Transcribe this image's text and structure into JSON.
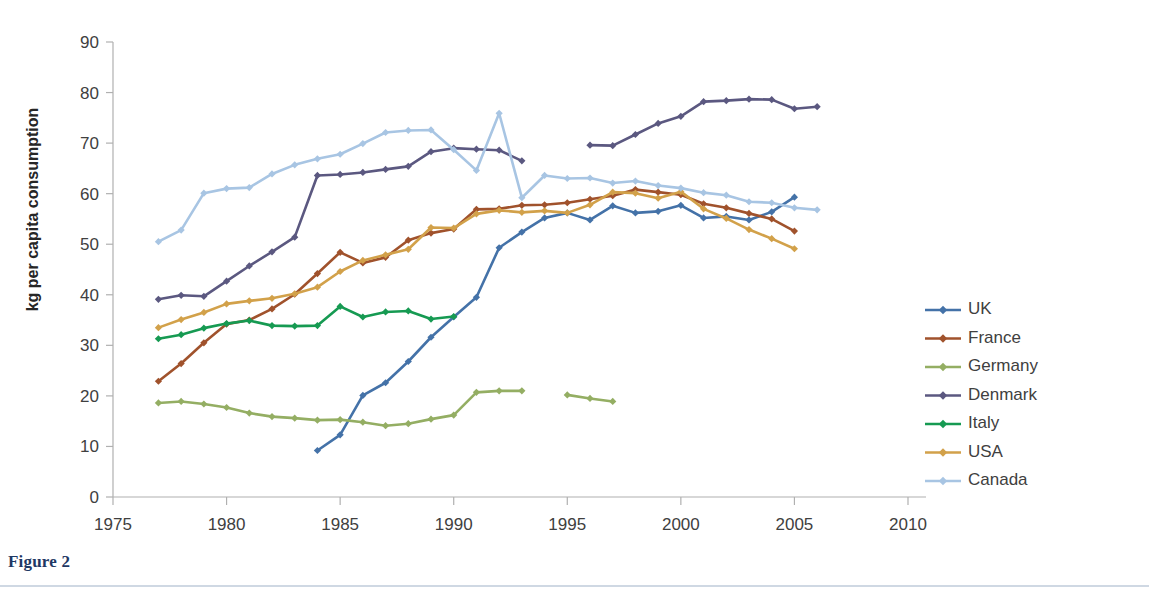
{
  "figure": {
    "caption": "Figure 2"
  },
  "chart_data": {
    "type": "line",
    "title": "",
    "xlabel": "",
    "ylabel": "kg per capita consumption",
    "xlim": [
      1975,
      2010
    ],
    "ylim": [
      0,
      90
    ],
    "xticks": [
      1975,
      1980,
      1985,
      1990,
      1995,
      2000,
      2005,
      2010
    ],
    "yticks": [
      0,
      10,
      20,
      30,
      40,
      50,
      60,
      70,
      80,
      90
    ],
    "grid": false,
    "legend_position": "right",
    "marker": "diamond",
    "series": [
      {
        "name": "UK",
        "color": "#4472a8",
        "x": [
          1984,
          1985,
          1986,
          1987,
          1988,
          1989,
          1990,
          1991,
          1992,
          1993,
          1994,
          1995,
          1996,
          1997,
          1998,
          1999,
          2000,
          2001,
          2002,
          2003,
          2004,
          2005
        ],
        "values": [
          9.2,
          12.3,
          20.1,
          22.6,
          26.8,
          31.6,
          35.6,
          39.5,
          49.3,
          52.4,
          55.2,
          56.2,
          54.8,
          57.6,
          56.2,
          56.5,
          57.7,
          55.2,
          55.5,
          54.8,
          56.4,
          59.3
        ]
      },
      {
        "name": "France",
        "color": "#a0522c",
        "x": [
          1977,
          1978,
          1979,
          1980,
          1981,
          1982,
          1983,
          1984,
          1985,
          1986,
          1987,
          1988,
          1989,
          1990,
          1991,
          1992,
          1993,
          1994,
          1995,
          1996,
          1997,
          1998,
          1999,
          2000,
          2001,
          2002,
          2003,
          2004,
          2005
        ],
        "values": [
          22.9,
          26.4,
          30.5,
          34.2,
          35.0,
          37.2,
          40.1,
          44.2,
          48.4,
          46.3,
          47.4,
          50.8,
          52.2,
          53.0,
          56.9,
          57.0,
          57.7,
          57.8,
          58.2,
          58.9,
          59.6,
          60.8,
          60.3,
          59.8,
          58.0,
          57.2,
          56.1,
          55.0,
          52.6
        ]
      },
      {
        "name": "Germany",
        "color": "#94ae63",
        "x": [
          1977,
          1978,
          1979,
          1980,
          1981,
          1982,
          1983,
          1984,
          1985,
          1986,
          1987,
          1988,
          1989,
          1990,
          1991,
          1992,
          1993
        ],
        "values": [
          18.6,
          18.9,
          18.4,
          17.7,
          16.6,
          15.9,
          15.6,
          15.2,
          15.3,
          14.8,
          14.1,
          14.5,
          15.4,
          16.2,
          20.7,
          21.0,
          21.0
        ],
        "gap_after": 1993,
        "x2": [
          1995,
          1996,
          1997
        ],
        "values2": [
          20.2,
          19.5,
          18.9
        ]
      },
      {
        "name": "Denmark",
        "color": "#5b5880",
        "x": [
          1977,
          1978,
          1979,
          1980,
          1981,
          1982,
          1983,
          1984,
          1985,
          1986,
          1987,
          1988,
          1989,
          1990,
          1991,
          1992,
          1993
        ],
        "values": [
          39.1,
          39.9,
          39.7,
          42.7,
          45.7,
          48.5,
          51.4,
          63.6,
          63.8,
          64.2,
          64.8,
          65.4,
          68.3,
          69.0,
          68.8,
          68.6,
          66.5
        ],
        "gap_after": 1993,
        "x2": [
          1996,
          1997,
          1998,
          1999,
          2000,
          2001,
          2002,
          2003,
          2004,
          2005,
          2006
        ],
        "values2": [
          69.6,
          69.5,
          71.7,
          73.9,
          75.3,
          78.2,
          78.4,
          78.7,
          78.6,
          76.8,
          77.2
        ]
      },
      {
        "name": "Italy",
        "color": "#169a52",
        "x": [
          1977,
          1978,
          1979,
          1980,
          1981,
          1982,
          1983,
          1984,
          1985,
          1986,
          1987,
          1988,
          1989,
          1990
        ],
        "values": [
          31.3,
          32.1,
          33.4,
          34.3,
          34.9,
          33.9,
          33.8,
          33.9,
          37.7,
          35.6,
          36.6,
          36.8,
          35.2,
          35.7
        ]
      },
      {
        "name": "USA",
        "color": "#d2a14a",
        "x": [
          1977,
          1978,
          1979,
          1980,
          1981,
          1982,
          1983,
          1984,
          1985,
          1986,
          1987,
          1988,
          1989,
          1990,
          1991,
          1992,
          1993,
          1994,
          1995,
          1996,
          1997,
          1998,
          1999,
          2000,
          2001,
          2002,
          2003,
          2004,
          2005
        ],
        "values": [
          33.5,
          35.1,
          36.5,
          38.2,
          38.8,
          39.3,
          40.2,
          41.5,
          44.6,
          46.8,
          47.9,
          49.0,
          53.3,
          53.2,
          56.0,
          56.7,
          56.3,
          56.6,
          56.2,
          57.8,
          60.3,
          60.1,
          59.1,
          60.4,
          57.0,
          55.1,
          52.9,
          51.1,
          49.1
        ]
      },
      {
        "name": "Canada",
        "color": "#a8c5e3",
        "x": [
          1977,
          1978,
          1979,
          1980,
          1981,
          1982,
          1983,
          1984,
          1985,
          1986,
          1987,
          1988,
          1989,
          1990,
          1991,
          1992,
          1993,
          1994,
          1995,
          1996,
          1997,
          1998,
          1999,
          2000,
          2001,
          2002,
          2003,
          2004,
          2005,
          2006
        ],
        "values": [
          50.5,
          52.8,
          60.1,
          61.0,
          61.2,
          63.9,
          65.7,
          66.9,
          67.8,
          69.9,
          72.1,
          72.5,
          72.6,
          68.7,
          64.6,
          75.9,
          59.2,
          63.6,
          63.0,
          63.1,
          62.1,
          62.5,
          61.6,
          61.1,
          60.2,
          59.7,
          58.4,
          58.2,
          57.2,
          56.8
        ]
      }
    ]
  },
  "axis_color": "#b0b0b0",
  "text_color": "#404040",
  "caption_color": "#1f3864"
}
